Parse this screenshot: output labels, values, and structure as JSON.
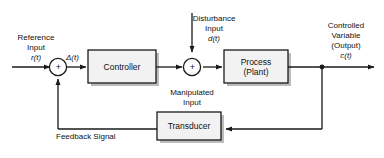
{
  "diagram": {
    "colors": {
      "line": "#1a1a1a",
      "block_fill": "#f2f2f2",
      "block_stroke": "#1a1a1a",
      "shadow": "#bdbdbd",
      "background": "#ffffff",
      "text": "#111111"
    },
    "blocks": [
      {
        "id": "controller",
        "label": "Controller"
      },
      {
        "id": "process",
        "label_line1": "Process",
        "label_line2": "(Plant)"
      },
      {
        "id": "transducer",
        "label": "Transducer"
      }
    ],
    "junctions": [
      {
        "id": "sum-error",
        "sign": "+"
      },
      {
        "id": "sum-disturbance",
        "sign": "+"
      }
    ],
    "labels": {
      "reference_input_line1": "Reference",
      "reference_input_line2": "Input",
      "reference_input_symbol": "r(t)",
      "error_symbol": "Δ(t)",
      "disturbance_line1": "Disturbance",
      "disturbance_line2": "Input",
      "disturbance_symbol": "d(t)",
      "manipulated_line1": "Manipulated",
      "manipulated_line2": "Input",
      "controlled_line1": "Controlled",
      "controlled_line2": "Variable",
      "controlled_line3": "(Output)",
      "controlled_symbol": "c(t)",
      "feedback_signal": "Feedback Signal"
    }
  }
}
